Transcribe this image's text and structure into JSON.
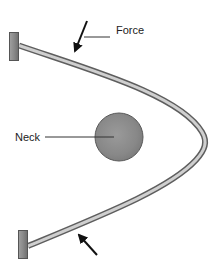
{
  "diagram": {
    "labels": {
      "force": "Force",
      "neck": "Neck"
    },
    "colors": {
      "background": "#ffffff",
      "bar_outline": "#6a6a6a",
      "bar_fill": "#c8c8c8",
      "block_fill": "#8c8c8c",
      "block_outline": "#555555",
      "neck_fill": "#8e8e8e",
      "neck_outline": "#5a5a5a",
      "arrow": "#111111",
      "leader_line": "#333333"
    },
    "elements": {
      "top_anchor_block": "anchor-block",
      "bottom_anchor_block": "anchor-block",
      "bent_bar": "curved-rod",
      "neck": "circle",
      "force_arrow_top": "arrow-down-left",
      "force_arrow_bottom": "arrow-up-left"
    }
  }
}
